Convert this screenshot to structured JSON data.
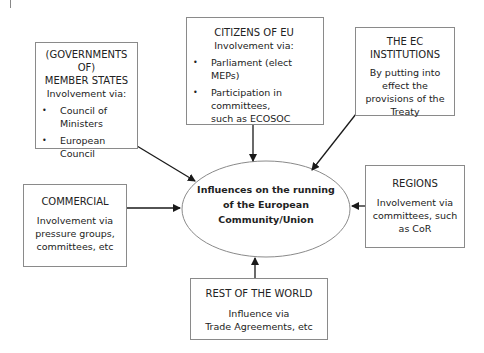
{
  "diagram": {
    "center": {
      "lines": [
        "Influences on the running",
        "of the European",
        "Community/Union"
      ]
    },
    "boxes": {
      "member_states": {
        "title_lines": [
          "(GOVERNMENTS OF)",
          "MEMBER STATES"
        ],
        "subtitle": "Involvement via:",
        "bullets": [
          "Council of Ministers",
          "European Council"
        ]
      },
      "citizens": {
        "title": "CITIZENS OF EU",
        "subtitle": "Involvement via:",
        "bullets": [
          "Parliament (elect MEPs)",
          "Participation in committees, such as ECOSOC"
        ]
      },
      "ec_institutions": {
        "title_lines": [
          "THE EC",
          "INSTITUTIONS"
        ],
        "body": "By putting into effect the provisions of the Treaty"
      },
      "commercial": {
        "title": "COMMERCIAL",
        "body": "Involvement via pressure groups, committees, etc"
      },
      "regions": {
        "title": "REGIONS",
        "body": "Involvement via committees, such as CoR"
      },
      "rest_of_world": {
        "title": "REST OF THE WORLD",
        "body_lines": [
          "Influence via",
          "Trade Agreements, etc"
        ]
      }
    },
    "colors": {
      "line": "#1a1a1a",
      "box_border": "#8a8a8a",
      "text": "#222222"
    }
  }
}
